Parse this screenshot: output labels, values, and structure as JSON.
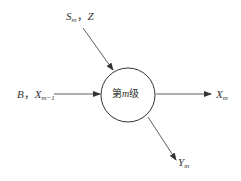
{
  "diagram": {
    "node": {
      "prefix": "第",
      "var": "m",
      "suffix": "级",
      "shape": "circle",
      "center": [
        128,
        95
      ],
      "radius": 27
    },
    "inputs": [
      {
        "id": "top",
        "var1": "S",
        "sub1": "m",
        "sep": "，",
        "var2": "Z"
      },
      {
        "id": "left",
        "var1": "B",
        "sep": "，",
        "var2": "X",
        "sub2": "m−1"
      }
    ],
    "outputs": [
      {
        "id": "right",
        "var": "X",
        "sub": "m"
      },
      {
        "id": "bottom",
        "var": "Y",
        "sub": "m"
      }
    ],
    "colors": {
      "line": "#333333",
      "text": "#333333",
      "background": "#ffffff"
    }
  }
}
